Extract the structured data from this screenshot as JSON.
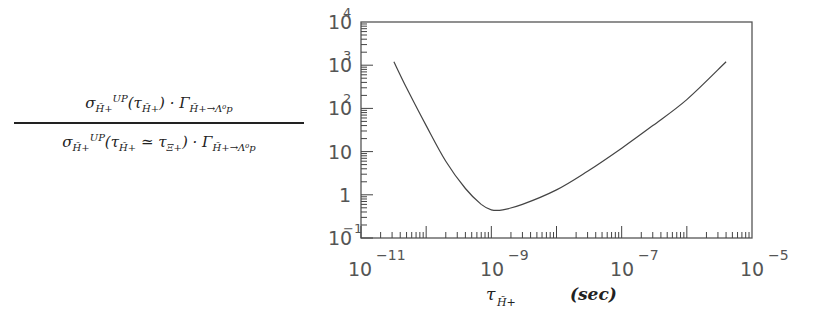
{
  "ylabel": {
    "numerator": "σ^UP_H̃+(τ_H̃+) · Γ_H̃+→Λ⁰p",
    "denominator": "σ^UP_H̃+(τ_H̃+ ≃ τ_Ξ+) · Γ_H̃+→Λ⁰p",
    "num_parts": {
      "sigma": "σ",
      "sup": "UP",
      "sub": "H̃+",
      "arg": "(τ",
      "arg_sub": "H̃+",
      "close": ") · Γ",
      "gamma_sub": "H̃+→Λ⁰p"
    },
    "den_parts": {
      "sigma": "σ",
      "sup": "UP",
      "sub": "H̃+",
      "arg": "(τ",
      "arg_sub": "H̃+",
      "sim": " ≃ τ",
      "xi_sub": "Ξ+",
      "close": ") · Γ",
      "gamma_sub": "H̃+→Λ⁰p"
    }
  },
  "xaxis": {
    "label_symbol": "τ",
    "label_sub": "H̃+",
    "unit": "(sec)",
    "tick_labels": [
      {
        "base": "10",
        "exp": "−11"
      },
      {
        "base": "10",
        "exp": "−9"
      },
      {
        "base": "10",
        "exp": "−7"
      },
      {
        "base": "10",
        "exp": "−5"
      }
    ]
  },
  "yaxis": {
    "tick_labels": [
      {
        "base": "10",
        "exp": "4"
      },
      {
        "base": "10",
        "exp": "3"
      },
      {
        "base": "10",
        "exp": "2"
      },
      {
        "base": "10",
        "exp": ""
      },
      {
        "base": "1",
        "exp": ""
      },
      {
        "base": "10",
        "exp": "−1"
      }
    ]
  },
  "chart_data": {
    "type": "line",
    "title": "",
    "xlabel": "τ_H̃+ (sec)",
    "ylabel": "σ^UP_H̃+(τ_H̃+)·Γ_H̃+→Λ⁰p / σ^UP_H̃+(τ_H̃+ ≃ τ_Ξ+)·Γ_H̃+→Λ⁰p",
    "xscale": "log",
    "yscale": "log",
    "xlim": [
      1e-12,
      1e-06
    ],
    "ylim": [
      0.1,
      10000
    ],
    "x_tick_labels": [
      "10^-11",
      "10^-9",
      "10^-7",
      "10^-5"
    ],
    "y_tick_labels": [
      "10^4",
      "10^3",
      "10^2",
      "10",
      "1",
      "10^-1"
    ],
    "grid": false,
    "series": [
      {
        "name": "ratio",
        "x": [
          3.2e-12,
          5e-12,
          1e-11,
          2e-11,
          4e-11,
          7e-11,
          1e-10,
          1.5e-10,
          3e-10,
          1e-09,
          3e-09,
          1e-08,
          3e-08,
          1e-07,
          4e-07
        ],
        "y": [
          1200,
          300,
          40,
          6,
          1.4,
          0.6,
          0.45,
          0.45,
          0.6,
          1.3,
          3.5,
          12,
          40,
          160,
          1200
        ]
      }
    ]
  }
}
